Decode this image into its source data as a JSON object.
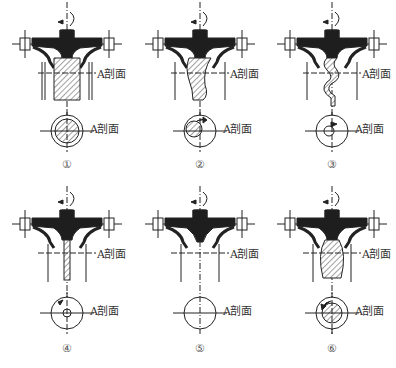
{
  "figure": {
    "section_label": "A剖面",
    "panels": [
      {
        "number": "①",
        "pattern": "full-hatched-straight-core",
        "core": "straight",
        "section_view": "hatched-full-circle"
      },
      {
        "number": "②",
        "pattern": "offset-swirl-core",
        "core": "curved",
        "section_view": "offset-hatched-circle-with-arrow"
      },
      {
        "number": "③",
        "pattern": "thin-spiral-core",
        "core": "spiral",
        "section_view": "small-offset-circle-with-arrow"
      },
      {
        "number": "④",
        "pattern": "thin-central-core",
        "core": "thin-straight",
        "section_view": "small-center-circle-with-arrow"
      },
      {
        "number": "⑤",
        "pattern": "no-core",
        "core": "none",
        "section_view": "empty-circle"
      },
      {
        "number": "⑥",
        "pattern": "bulged-core",
        "core": "bulged",
        "section_view": "hatched-center-circle-with-arrow"
      }
    ]
  },
  "colors": {
    "ink": "#222222",
    "fill": "#1e1e1e",
    "hatch": "#444444",
    "background": "#ffffff"
  }
}
